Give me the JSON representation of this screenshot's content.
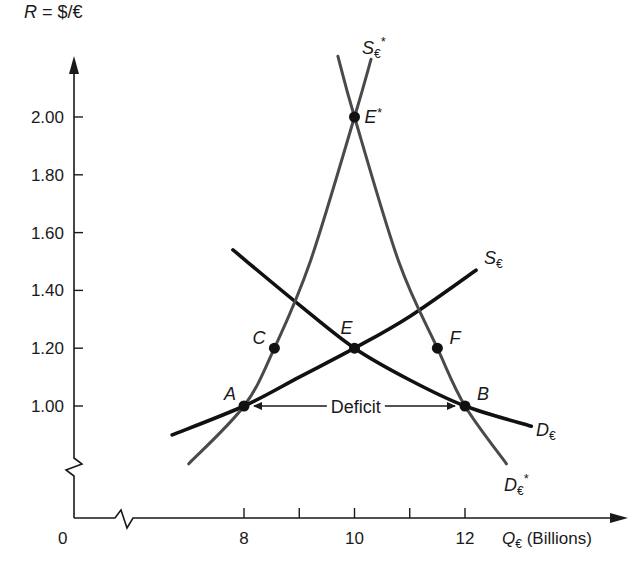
{
  "chart_data": {
    "type": "line",
    "title": "",
    "xlabel": "Q€ (Billions)",
    "ylabel": "R = $/€",
    "x_origin_label": "0",
    "xticks": [
      8,
      9,
      10,
      11,
      12
    ],
    "xtick_labels": [
      "8",
      "",
      "10",
      "",
      "12"
    ],
    "yticks": [
      1.0,
      1.2,
      1.4,
      1.6,
      1.8,
      2.0
    ],
    "ytick_labels": [
      "1.00",
      "1.20",
      "1.40",
      "1.60",
      "1.80",
      "2.00"
    ],
    "xlim": [
      6.4,
      13.2
    ],
    "ylim": [
      0.8,
      2.2
    ],
    "axis_breaks": [
      "x",
      "y"
    ],
    "grid": false,
    "series": [
      {
        "name": "S€",
        "label_main": "S",
        "label_sub": "€",
        "label_star": "",
        "color": "#111111",
        "points": [
          [
            6.7,
            0.9
          ],
          [
            8.0,
            1.0
          ],
          [
            9.0,
            1.1
          ],
          [
            10.0,
            1.2
          ],
          [
            11.0,
            1.31
          ],
          [
            12.2,
            1.47
          ]
        ]
      },
      {
        "name": "D€",
        "label_main": "D",
        "label_sub": "€",
        "label_star": "",
        "color": "#111111",
        "points": [
          [
            7.8,
            1.54
          ],
          [
            9.0,
            1.35
          ],
          [
            10.0,
            1.2
          ],
          [
            11.0,
            1.09
          ],
          [
            12.0,
            1.0
          ],
          [
            13.2,
            0.93
          ]
        ]
      },
      {
        "name": "S€*",
        "label_main": "S",
        "label_sub": "€",
        "label_star": "*",
        "color": "#4a4a4a",
        "points": [
          [
            7.0,
            0.8
          ],
          [
            8.0,
            1.0
          ],
          [
            8.55,
            1.2
          ],
          [
            9.2,
            1.5
          ],
          [
            10.0,
            2.0
          ],
          [
            10.3,
            2.2
          ]
        ]
      },
      {
        "name": "D€*",
        "label_main": "D",
        "label_sub": "€",
        "label_star": "*",
        "color": "#4a4a4a",
        "points": [
          [
            9.7,
            2.21
          ],
          [
            10.0,
            2.0
          ],
          [
            10.8,
            1.5
          ],
          [
            11.5,
            1.2
          ],
          [
            12.0,
            1.0
          ],
          [
            12.75,
            0.8
          ]
        ]
      }
    ],
    "annotations": [
      {
        "label": "A",
        "x": 8.0,
        "y": 1.0
      },
      {
        "label": "B",
        "x": 12.0,
        "y": 1.0
      },
      {
        "label": "C",
        "x": 8.55,
        "y": 1.2
      },
      {
        "label": "E",
        "x": 10.0,
        "y": 1.2
      },
      {
        "label": "F",
        "x": 11.5,
        "y": 1.2
      },
      {
        "label": "E*",
        "x": 10.0,
        "y": 2.0
      }
    ],
    "deficit": {
      "label": "Deficit",
      "from_x": 8.0,
      "to_x": 12.0,
      "y": 1.0
    }
  }
}
